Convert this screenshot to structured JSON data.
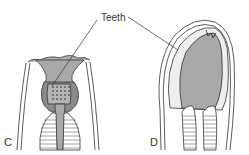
{
  "diagram": {
    "labels": {
      "teeth": "Teeth",
      "panel_c": "C",
      "panel_d": "D"
    },
    "colors": {
      "fill_gray": "#a9a9a9",
      "fill_dark": "#7d7d7d",
      "line": "#333333",
      "background": "#ffffff"
    }
  }
}
